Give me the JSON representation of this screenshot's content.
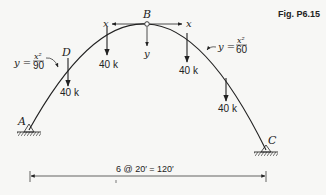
{
  "figure": {
    "caption": "Fig. P6.15"
  },
  "arch": {
    "left_equation": {
      "lhs": "y =",
      "num": "x²",
      "den": "90"
    },
    "right_equation": {
      "lhs": "y =",
      "num": "x²",
      "den": "60"
    },
    "points": {
      "A": "A",
      "B": "B",
      "C": "C",
      "D": "D"
    },
    "axes": {
      "x_left": "x",
      "x_right": "x",
      "y": "y"
    }
  },
  "loads": [
    {
      "id": "load-1",
      "label": "40 k"
    },
    {
      "id": "load-2",
      "label": "40 k"
    },
    {
      "id": "load-3",
      "label": "40 k"
    },
    {
      "id": "load-4",
      "label": "40 k"
    }
  ],
  "dimension": {
    "label": "6 @ 20′ = 120′"
  }
}
